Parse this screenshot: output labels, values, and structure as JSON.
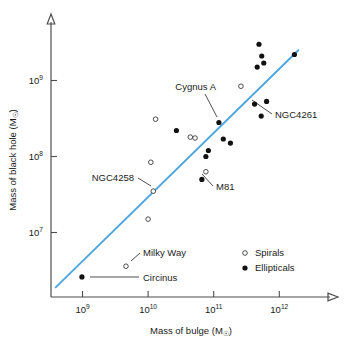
{
  "chart_data": {
    "type": "scatter",
    "title": "",
    "xlabel": "Mass of bulge (M☉)",
    "ylabel": "Mass of black hole (M☉)",
    "xscale": "log",
    "yscale": "log",
    "xlim": [
      320000000.0,
      4000000000000.0
    ],
    "ylim": [
      1500000.0,
      5500000000.0
    ],
    "grid": false,
    "legend_position": "lower-right",
    "xticks": [
      {
        "value": 1000000000.0,
        "label_base": "10",
        "label_exp": "9"
      },
      {
        "value": 10000000000.0,
        "label_base": "10",
        "label_exp": "10"
      },
      {
        "value": 100000000000.0,
        "label_base": "10",
        "label_exp": "11"
      },
      {
        "value": 1000000000000.0,
        "label_base": "10",
        "label_exp": "12"
      }
    ],
    "yticks": [
      {
        "value": 10000000.0,
        "label_base": "10",
        "label_exp": "7"
      },
      {
        "value": 100000000.0,
        "label_base": "10",
        "label_exp": "8"
      },
      {
        "value": 1000000000.0,
        "label_base": "10",
        "label_exp": "9"
      }
    ],
    "legend": [
      {
        "name": "Spirals",
        "marker": "open-circle"
      },
      {
        "name": "Ellipticals",
        "marker": "filled-circle"
      }
    ],
    "series": [
      {
        "name": "Spirals",
        "marker": "open-circle",
        "points": [
          {
            "x": 4600000000.0,
            "y": 3600000.0,
            "label": "Milky Way"
          },
          {
            "x": 10000000000.0,
            "y": 15000000.0,
            "label": ""
          },
          {
            "x": 12000000000.0,
            "y": 35000000.0,
            "label": "NGC4258"
          },
          {
            "x": 11000000000.0,
            "y": 84000000.0,
            "label": ""
          },
          {
            "x": 13000000000.0,
            "y": 310000000.0,
            "label": ""
          },
          {
            "x": 44000000000.0,
            "y": 180000000.0,
            "label": ""
          },
          {
            "x": 52000000000.0,
            "y": 175000000.0,
            "label": ""
          },
          {
            "x": 76000000000.0,
            "y": 63000000.0,
            "label": "M81"
          },
          {
            "x": 260000000000.0,
            "y": 840000000.0,
            "label": ""
          }
        ]
      },
      {
        "name": "Ellipticals",
        "marker": "filled-circle",
        "points": [
          {
            "x": 980000000.0,
            "y": 2600000.0,
            "label": "Circinus"
          },
          {
            "x": 27000000000.0,
            "y": 220000000.0,
            "label": ""
          },
          {
            "x": 66000000000.0,
            "y": 50000000.0,
            "label": ""
          },
          {
            "x": 76000000000.0,
            "y": 100000000.0,
            "label": ""
          },
          {
            "x": 83000000000.0,
            "y": 120000000.0,
            "label": ""
          },
          {
            "x": 120000000000.0,
            "y": 280000000.0,
            "label": "Cygnus A"
          },
          {
            "x": 140000000000.0,
            "y": 170000000.0,
            "label": ""
          },
          {
            "x": 180000000000.0,
            "y": 150000000.0,
            "label": ""
          },
          {
            "x": 420000000000.0,
            "y": 490000000.0,
            "label": ""
          },
          {
            "x": 460000000000.0,
            "y": 1500000000.0,
            "label": ""
          },
          {
            "x": 490000000000.0,
            "y": 3000000000.0,
            "label": ""
          },
          {
            "x": 540000000000.0,
            "y": 2100000000.0,
            "label": ""
          },
          {
            "x": 580000000000.0,
            "y": 1700000000.0,
            "label": ""
          },
          {
            "x": 530000000000.0,
            "y": 340000000.0,
            "label": ""
          },
          {
            "x": 640000000000.0,
            "y": 530000000.0,
            "label": "NGC4261"
          },
          {
            "x": 1700000000000.0,
            "y": 2200000000.0,
            "label": ""
          }
        ]
      }
    ],
    "trend_line": {
      "color": "#4ea6dd",
      "x_start": 390000000.0,
      "y_start": 1900000.0,
      "x_end": 1950000000000.0,
      "y_end": 2500000000.0
    },
    "annotations": [
      {
        "text": "Cygnus A",
        "anchor": "end",
        "label_x": 216,
        "label_y": 90,
        "lead_x1": 205,
        "lead_y1": 94,
        "lead_x2": 217,
        "lead_y2": 117
      },
      {
        "text": "NGC4261",
        "anchor": "start",
        "label_x": 275,
        "label_y": 118,
        "lead_x1": 272,
        "lead_y1": 114,
        "lead_x2": 252,
        "lead_y2": 100
      },
      {
        "text": "NGC4258",
        "anchor": "end",
        "label_x": 134,
        "label_y": 181,
        "lead_x1": 138,
        "lead_y1": 178,
        "lead_x2": 151,
        "lead_y2": 186
      },
      {
        "text": "M81",
        "anchor": "start",
        "label_x": 216,
        "label_y": 190,
        "lead_x1": 213,
        "lead_y1": 186,
        "lead_x2": 202,
        "lead_y2": 174
      },
      {
        "text": "Milky Way",
        "anchor": "start",
        "label_x": 143,
        "label_y": 256,
        "lead_x1": 140,
        "lead_y1": 253,
        "lead_x2": 131,
        "lead_y2": 261
      },
      {
        "text": "Circinus",
        "anchor": "start",
        "label_x": 143,
        "label_y": 281,
        "lead_x1": 139,
        "lead_y1": 277,
        "lead_x2": 90,
        "lead_y2": 277
      }
    ]
  }
}
